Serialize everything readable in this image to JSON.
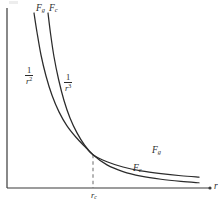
{
  "figure": {
    "type": "line-plot",
    "background_color": "#ffffff",
    "ink_color": "#2b2b2b",
    "corner_mark": ""
  },
  "axes": {
    "x_axis_label": "r",
    "y_axis_label": "",
    "x_axis_arrow": "dot-arrow",
    "origin_x_px": 7,
    "origin_y_px": 188,
    "x_end_px": 214,
    "y_top_px": 8
  },
  "ticks": {
    "x": [
      {
        "label_base": "r",
        "label_sub": "c",
        "x_px": 96,
        "guide": "dashed"
      }
    ]
  },
  "curve_top_labels": [
    {
      "base": "F",
      "sub": "g",
      "x_px": 36,
      "y_px": 6
    },
    {
      "base": "F",
      "sub": "c",
      "x_px": 49,
      "y_px": 6
    }
  ],
  "power_labels": [
    {
      "numerator": "1",
      "denominator_base": "r",
      "denominator_exp": "2",
      "x_px": 26,
      "y_px": 68
    },
    {
      "numerator": "1",
      "denominator_base": "r",
      "denominator_exp": "3",
      "x_px": 64,
      "y_px": 74
    }
  ],
  "curve_tail_labels": [
    {
      "base": "F",
      "sub": "g",
      "x_px": 152,
      "y_px": 148
    },
    {
      "base": "F",
      "sub": "c",
      "x_px": 133,
      "y_px": 166
    }
  ],
  "chart_data": {
    "type": "line",
    "title": "",
    "xlabel": "r",
    "ylabel": "",
    "grid": false,
    "legend_position": "inline-curve-labels",
    "annotations": [
      "F_g",
      "F_c",
      "1/r^2",
      "1/r^3",
      "r_c"
    ],
    "xlim": [
      0,
      1
    ],
    "ylim": [
      0,
      1
    ],
    "crossover": {
      "x": 0.43,
      "y": 0.19,
      "label": "r_c"
    },
    "series": [
      {
        "name": "F_g",
        "relation": "1/r^2",
        "label_top": "F_g",
        "label_tail": "F_g",
        "label_power": "1/r^2",
        "x": [
          0.135,
          0.15,
          0.17,
          0.195,
          0.225,
          0.26,
          0.3,
          0.345,
          0.395,
          0.43,
          0.5,
          0.58,
          0.67,
          0.77,
          0.87,
          0.96
        ],
        "y": [
          1.0,
          0.89,
          0.76,
          0.64,
          0.53,
          0.435,
          0.355,
          0.29,
          0.23,
          0.19,
          0.15,
          0.12,
          0.098,
          0.082,
          0.07,
          0.062
        ]
      },
      {
        "name": "F_c",
        "relation": "1/r^3",
        "label_top": "F_c",
        "label_tail": "F_c",
        "label_power": "1/r^3",
        "x": [
          0.205,
          0.218,
          0.235,
          0.258,
          0.285,
          0.315,
          0.35,
          0.388,
          0.43,
          0.5,
          0.58,
          0.67,
          0.77,
          0.87,
          0.96
        ],
        "y": [
          1.0,
          0.88,
          0.75,
          0.62,
          0.5,
          0.4,
          0.315,
          0.245,
          0.19,
          0.132,
          0.094,
          0.068,
          0.05,
          0.038,
          0.03
        ]
      }
    ]
  }
}
